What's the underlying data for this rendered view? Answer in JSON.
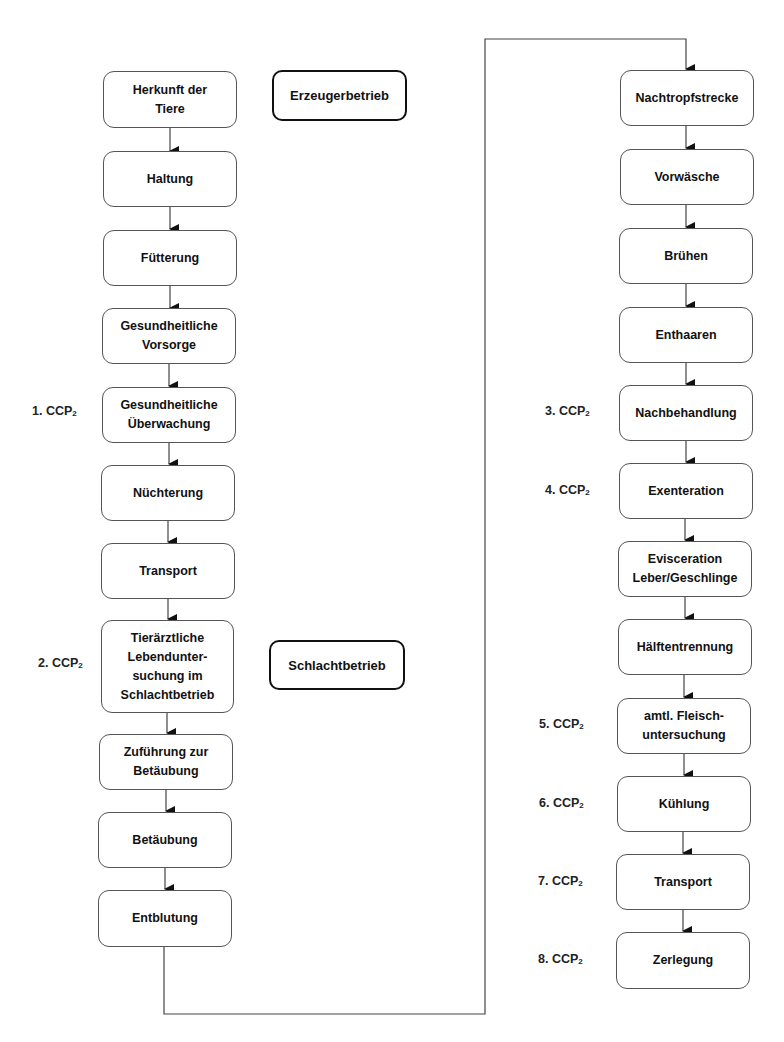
{
  "diagram": {
    "type": "flowchart",
    "sections": [
      {
        "id": "erzeuger",
        "label": "Erzeugerbetrieb"
      },
      {
        "id": "schlacht",
        "label": "Schlachtbetrieb"
      }
    ],
    "left_column": [
      {
        "label": "Herkunft der\nTiere",
        "ccp": null
      },
      {
        "label": "Haltung",
        "ccp": null
      },
      {
        "label": "Fütterung",
        "ccp": null
      },
      {
        "label": "Gesundheitliche\nVorsorge",
        "ccp": null
      },
      {
        "label": "Gesundheitliche\nÜberwachung",
        "ccp": "1. CCP"
      },
      {
        "label": "Nüchterung",
        "ccp": null
      },
      {
        "label": "Transport",
        "ccp": null
      },
      {
        "label": "Tierärztliche\nLebendunter-\nsuchung im\nSchlachtbetrieb",
        "ccp": "2. CCP"
      },
      {
        "label": "Zuführung zur\nBetäubung",
        "ccp": null
      },
      {
        "label": "Betäubung",
        "ccp": null
      },
      {
        "label": "Entblutung",
        "ccp": null
      }
    ],
    "right_column": [
      {
        "label": "Nachtropfstrecke",
        "ccp": null
      },
      {
        "label": "Vorwäsche",
        "ccp": null
      },
      {
        "label": "Brühen",
        "ccp": null
      },
      {
        "label": "Enthaaren",
        "ccp": null
      },
      {
        "label": "Nachbehandlung",
        "ccp": "3. CCP"
      },
      {
        "label": "Exenteration",
        "ccp": "4. CCP"
      },
      {
        "label": "Evisceration\nLeber/Geschlinge",
        "ccp": null
      },
      {
        "label": "Hälftentrennung",
        "ccp": null
      },
      {
        "label": "amtl. Fleisch-\nuntersuchung",
        "ccp": "5. CCP"
      },
      {
        "label": "Kühlung",
        "ccp": "6. CCP"
      },
      {
        "label": "Transport",
        "ccp": "7. CCP"
      },
      {
        "label": "Zerlegung",
        "ccp": "8. CCP"
      }
    ],
    "ccp_subscript": "2"
  }
}
